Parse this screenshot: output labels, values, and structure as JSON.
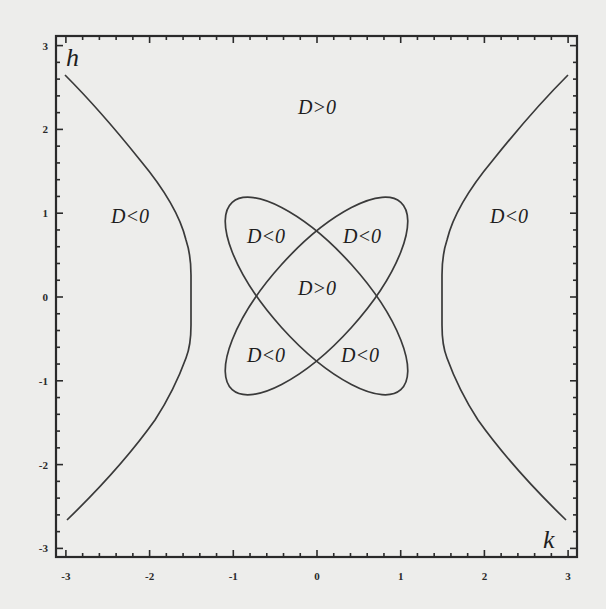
{
  "chart_data": {
    "type": "line",
    "title": "",
    "xlabel": "k",
    "ylabel": "h",
    "xlim": [
      -3.1,
      3.1
    ],
    "ylim": [
      -3.1,
      3.1
    ],
    "grid": false,
    "legend": "none",
    "x_ticks": [
      -3,
      -2,
      -1,
      0,
      1,
      2,
      3
    ],
    "y_ticks": [
      -3,
      -2,
      -1,
      0,
      1,
      2,
      3
    ],
    "x_tick_labels": [
      "-3",
      "-2",
      "-1",
      "0",
      "1",
      "2",
      "3"
    ],
    "y_tick_labels": [
      "3",
      "2",
      "1",
      "0",
      "-1",
      "-2",
      "-3"
    ],
    "series": [
      {
        "name": "left branch (D=0)",
        "points": [
          [
            -3.0,
            2.7
          ],
          [
            -2.4,
            1.9
          ],
          [
            -1.8,
            1.3
          ],
          [
            -1.58,
            0.8
          ],
          [
            -1.5,
            0.5
          ],
          [
            -1.5,
            0.0
          ],
          [
            -1.5,
            -0.5
          ],
          [
            -1.58,
            -0.8
          ],
          [
            -1.9,
            -1.45
          ],
          [
            -2.5,
            -2.1
          ],
          [
            -3.0,
            -2.65
          ]
        ]
      },
      {
        "name": "right branch (D=0)",
        "points": [
          [
            3.0,
            2.7
          ],
          [
            2.4,
            1.9
          ],
          [
            1.8,
            1.3
          ],
          [
            1.58,
            0.8
          ],
          [
            1.5,
            0.5
          ],
          [
            1.5,
            0.0
          ],
          [
            1.5,
            -0.5
          ],
          [
            1.58,
            -0.8
          ],
          [
            1.9,
            -1.45
          ],
          [
            2.5,
            -2.1
          ],
          [
            3.0,
            -2.65
          ]
        ]
      },
      {
        "name": "ellipse along h = -k (D=0)",
        "center": [
          0,
          0
        ],
        "rotation_deg": -45,
        "extent": {
          "k": [
            -1.03,
            1.03
          ],
          "h": [
            -1.25,
            1.25
          ]
        }
      },
      {
        "name": "ellipse along h = k (D=0)",
        "center": [
          0,
          0
        ],
        "rotation_deg": 45,
        "extent": {
          "k": [
            -1.03,
            1.03
          ],
          "h": [
            -1.25,
            1.25
          ]
        }
      }
    ],
    "crossing_points": [
      [
        0,
        0.7
      ],
      [
        0,
        -0.68
      ],
      [
        -0.57,
        0
      ],
      [
        0.55,
        0
      ]
    ],
    "annotations": [
      {
        "text": "D>0",
        "k": 0.05,
        "h": 2.3
      },
      {
        "text": "D<0",
        "k": -2.25,
        "h": 0.95
      },
      {
        "text": "D<0",
        "k": 2.25,
        "h": 0.95
      },
      {
        "text": "D<0",
        "k": -0.6,
        "h": 0.7
      },
      {
        "text": "D<0",
        "k": 0.6,
        "h": 0.7
      },
      {
        "text": "D>0",
        "k": 0.05,
        "h": 0.1
      },
      {
        "text": "D<0",
        "k": -0.6,
        "h": -0.75
      },
      {
        "text": "D<0",
        "k": 0.6,
        "h": -0.75
      }
    ]
  },
  "axes": {
    "x_name": "k",
    "y_name": "h"
  },
  "labels": {
    "top_center": "D>0",
    "left_outer": "D<0",
    "right_outer": "D<0",
    "petal_upper_left": "D<0",
    "petal_upper_right": "D<0",
    "center": "D>0",
    "petal_lower_left": "D<0",
    "petal_lower_right": "D<0"
  },
  "colors": {
    "background": "#ededeb",
    "line": "#3a3a3a",
    "frame": "#2a2a2a",
    "text": "#1e1e1e"
  }
}
